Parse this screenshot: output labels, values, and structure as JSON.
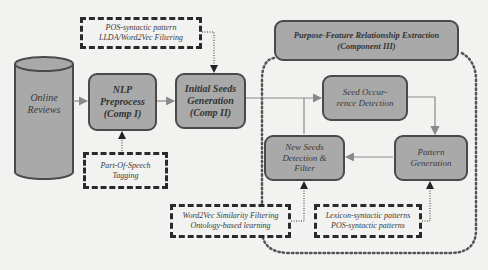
{
  "diagram": {
    "nodes": {
      "online_reviews": {
        "label_line1": "Online",
        "label_line2": "Reviews",
        "shape": "cylinder"
      },
      "nlp_preprocess": {
        "line1": "NLP",
        "line2": "Preprocess",
        "line3": "(Comp I)"
      },
      "initial_seeds": {
        "line1": "Initial Seeds",
        "line2": "Generation",
        "line3": "(Comp II)"
      },
      "component3_header": {
        "line1": "Purpose-Feature Relationship Extraction",
        "line2": "(Component III)"
      },
      "seed_occurrence": {
        "line1": "Seed Occur-",
        "line2": "rence Detection"
      },
      "new_seeds": {
        "line1": "New Seeds",
        "line2": "Detection &",
        "line3": "Filter"
      },
      "pattern_generation": {
        "line1": "Pattern",
        "line2": "Generation"
      }
    },
    "annotations": {
      "pos_lda": {
        "line1": "POS-syntactic pattern",
        "line2": "LLDA/Word2Vec Filtering"
      },
      "pos_tagging": {
        "line1": "Part-Of-Speech",
        "line2": "Tagging"
      },
      "word2vec": {
        "line1": "Word2Vec Similarity Filtering",
        "line2": "Ontology-based learning"
      },
      "lexicon": {
        "line1": "Lexicon-syntactic patterns",
        "line2": "POS-syntactic patterns"
      }
    },
    "colors": {
      "box_fill": "#a9a9a9",
      "box_border": "#4a4a4a",
      "background": "#f2f2f0",
      "arrow": "#8a8a8a"
    }
  }
}
